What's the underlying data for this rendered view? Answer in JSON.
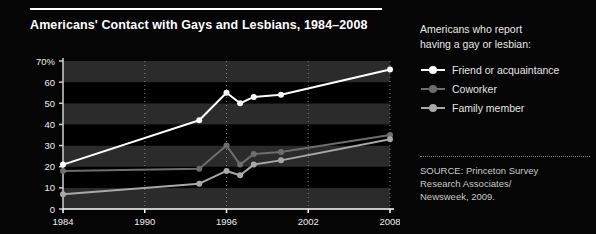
{
  "chart": {
    "title": "Americans' Contact with Gays and Lesbians, 1984–2008"
  },
  "legend": {
    "heading_line1": "Americans who report",
    "heading_line2": "having a gay or lesbian:",
    "items": [
      {
        "label": "Friend or acquaintance",
        "color": "#ffffff",
        "marker": "circle-marker"
      },
      {
        "label": "Coworker",
        "color": "#6d6d6d",
        "marker": "circle-marker"
      },
      {
        "label": "Family member",
        "color": "#a8a8a8",
        "marker": "circle-marker"
      }
    ]
  },
  "source": {
    "line1": "SOURCE: Princeton Survey",
    "line2": "Research Associates/",
    "line3": "Newsweek, 2009."
  },
  "chart_data": {
    "type": "line",
    "title": "Americans' Contact with Gays and Lesbians, 1984–2008",
    "xlabel": "",
    "ylabel": "",
    "xlim": [
      1984,
      2008
    ],
    "ylim": [
      0,
      70
    ],
    "grid": "horizontal-bands-and-vertical-dotted",
    "legend_position": "right",
    "xticks": [
      1984,
      1990,
      1996,
      2002,
      2008
    ],
    "xtick_labels": [
      "1984",
      "1990",
      "1996",
      "2002",
      "2008"
    ],
    "yticks": [
      0,
      10,
      20,
      30,
      40,
      50,
      60,
      70
    ],
    "ytick_labels": [
      "0",
      "10",
      "20",
      "30",
      "40",
      "50",
      "60",
      "70%"
    ],
    "series": [
      {
        "name": "Friend or acquaintance",
        "color": "#ffffff",
        "x": [
          1984,
          1994,
          1996,
          1997,
          1998,
          2000,
          2008
        ],
        "values": [
          21,
          42,
          55,
          50,
          53,
          54,
          66
        ]
      },
      {
        "name": "Coworker",
        "color": "#6d6d6d",
        "x": [
          1984,
          1994,
          1996,
          1997,
          1998,
          2000,
          2008
        ],
        "values": [
          18,
          19,
          30,
          21,
          26,
          27,
          35
        ]
      },
      {
        "name": "Family member",
        "color": "#a8a8a8",
        "x": [
          1984,
          1994,
          1996,
          1997,
          1998,
          2000,
          2008
        ],
        "values": [
          7,
          12,
          18,
          16,
          21,
          23,
          33
        ]
      }
    ]
  }
}
